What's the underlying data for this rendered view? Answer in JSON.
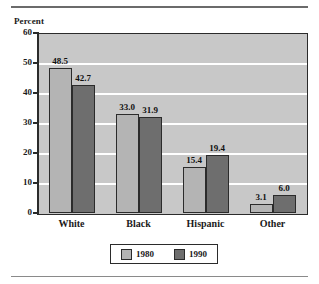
{
  "figure": {
    "ylabel": "Percent",
    "top_rule": true,
    "bottom_rule": true
  },
  "chart_data": {
    "type": "bar",
    "title": "",
    "xlabel": "",
    "ylabel": "Percent",
    "ylim": [
      0,
      60
    ],
    "yticks": [
      "0",
      "10",
      "20",
      "30",
      "40",
      "50",
      "60"
    ],
    "grid": true,
    "legend_position": "bottom-center",
    "categories": [
      "White",
      "Black",
      "Hispanic",
      "Other"
    ],
    "series": [
      {
        "name": "1980",
        "color": "#b4b4b4",
        "values": [
          48.5,
          33.0,
          15.4,
          3.1
        ],
        "labels": [
          "48.5",
          "33.0",
          "15.4",
          "3.1"
        ]
      },
      {
        "name": "1990",
        "color": "#6e6e6e",
        "values": [
          42.7,
          31.9,
          19.4,
          6.0
        ],
        "labels": [
          "42.7",
          "31.9",
          "19.4",
          "6.0"
        ]
      }
    ]
  }
}
